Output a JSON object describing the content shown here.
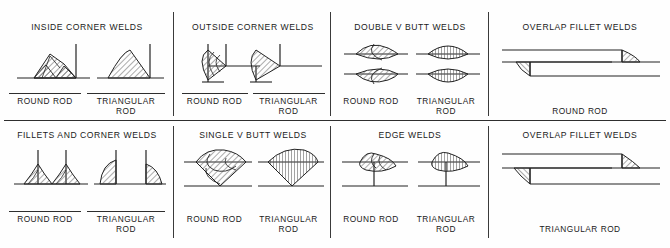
{
  "sheet": {
    "title": "Weld bead profile reference chart",
    "ink_color": "#1a1a1a",
    "rule_color": "#2e2e2e",
    "background": "#fefefe",
    "hatch_color": "#555555"
  },
  "labels": {
    "round_rod": "ROUND ROD",
    "triangular_rod_line1": "TRIANGULAR",
    "triangular_rod_line2": "ROD",
    "triangular_rod": "TRIANGULAR ROD"
  },
  "cells": [
    {
      "id": "inside-corner-welds",
      "title": "INSIDE CORNER WELDS",
      "row": 1,
      "column": 1,
      "captions": [
        "ROUND ROD",
        "TRIANGULAR ROD"
      ],
      "caption_layout": "two-up-ruled"
    },
    {
      "id": "outside-corner-welds",
      "title": "OUTSIDE CORNER WELDS",
      "row": 1,
      "column": 2,
      "captions": [
        "ROUND ROD",
        "TRIANGULAR ROD"
      ],
      "caption_layout": "two-up-ruled"
    },
    {
      "id": "double-v-butt-welds",
      "title": "DOUBLE V BUTT WELDS",
      "row": 1,
      "column": 3,
      "captions": [
        "ROUND ROD",
        "TRIANGULAR ROD"
      ],
      "caption_layout": "two-up"
    },
    {
      "id": "overlap-fillet-welds-round",
      "title": "OVERLAP FILLET WELDS",
      "row": 1,
      "column": 4,
      "captions": [
        "ROUND ROD"
      ],
      "caption_layout": "single"
    },
    {
      "id": "fillets-and-corner-welds",
      "title": "FILLETS AND CORNER WELDS",
      "row": 2,
      "column": 1,
      "captions": [
        "ROUND ROD",
        "TRIANGULAR ROD"
      ],
      "caption_layout": "two-up-ruled"
    },
    {
      "id": "single-v-butt-welds",
      "title": "SINGLE V BUTT WELDS",
      "row": 2,
      "column": 2,
      "captions": [
        "ROUND ROD",
        "TRIANGULAR ROD"
      ],
      "caption_layout": "two-up"
    },
    {
      "id": "edge-welds",
      "title": "EDGE WELDS",
      "row": 2,
      "column": 3,
      "captions": [
        "ROUND ROD",
        "TRIANGULAR ROD"
      ],
      "caption_layout": "two-up"
    },
    {
      "id": "overlap-fillet-welds-triangular",
      "title": "OVERLAP FILLET WELDS",
      "row": 2,
      "column": 4,
      "captions": [
        "TRIANGULAR ROD"
      ],
      "caption_layout": "single"
    }
  ]
}
